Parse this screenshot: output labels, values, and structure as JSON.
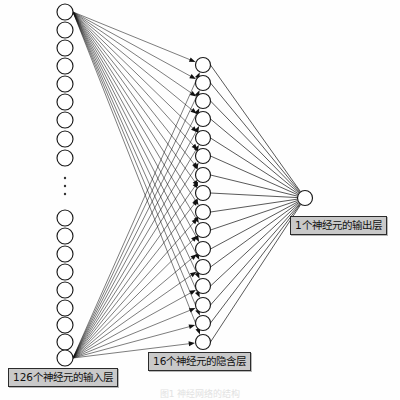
{
  "figure": {
    "caption": "图1  神经网络的结构",
    "background_color": "#fefefe",
    "node_stroke_color": "#1a1a1a",
    "node_fill_color": "#ffffff",
    "edge_color": "#111111",
    "label_background_color": "#c9c9c9",
    "label_border_color": "#2b2b2b",
    "label_text_color": "#111111"
  },
  "labels": {
    "input": "126个神经元的输入层",
    "hidden": "16个神经元的隐含层",
    "output": "1个神经元的输出层"
  },
  "chart_data": {
    "type": "diagram",
    "title": "图1  神经网络的结构",
    "layers": [
      {
        "name": "input",
        "label": "126个神经元的输入层",
        "neuron_count": 126,
        "drawn_nodes": 18,
        "ellipsis": true,
        "x": 65,
        "radius": 8,
        "nodes_top_y": [
          12,
          30,
          48,
          66,
          84,
          102,
          120,
          139,
          158
        ],
        "nodes_bottom_y": [
          218,
          236,
          254,
          272,
          290,
          308,
          325,
          342,
          358
        ],
        "ellipsis_dots_y": [
          178,
          186,
          194
        ]
      },
      {
        "name": "hidden",
        "label": "16个神经元的隐含层",
        "neuron_count": 16,
        "drawn_nodes": 16,
        "ellipsis": false,
        "x": 203,
        "radius": 7.5,
        "nodes_y": [
          65,
          83,
          101,
          119,
          138,
          156,
          175,
          193,
          212,
          230,
          249,
          267,
          286,
          305,
          323,
          342
        ]
      },
      {
        "name": "output",
        "label": "1个神经元的输出层",
        "neuron_count": 1,
        "drawn_nodes": 1,
        "ellipsis": false,
        "x": 305,
        "radius": 7.5,
        "nodes_y": [
          198
        ]
      }
    ],
    "connections": [
      {
        "from_layer": "input",
        "to_layer": "hidden",
        "drawn_from_node_indices": [
          0,
          17
        ],
        "to_all": true,
        "arrowheads": true,
        "style": "fan"
      },
      {
        "from_layer": "hidden",
        "to_layer": "output",
        "drawn_from_node_indices": "all",
        "to_all": true,
        "arrowheads": false,
        "style": "converging"
      }
    ]
  }
}
